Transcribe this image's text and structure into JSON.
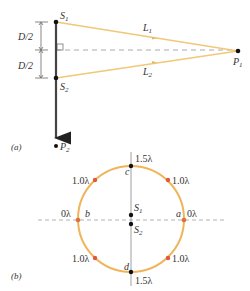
{
  "colors": {
    "ray": "#f0c878",
    "circle": "#f0b45a",
    "red_point": "#e0593a",
    "black": "#111111",
    "axis": "#999999",
    "dashed": "#aaaaaa"
  },
  "panel_a": {
    "label": "(a)",
    "sources": [
      {
        "name": "S",
        "sub": "1"
      },
      {
        "name": "S",
        "sub": "2"
      }
    ],
    "points": [
      {
        "name": "P",
        "sub": "1"
      },
      {
        "name": "P",
        "sub": "2"
      }
    ],
    "paths": [
      {
        "name": "L",
        "sub": "1"
      },
      {
        "name": "L",
        "sub": "2"
      }
    ],
    "dimension_upper": "D/2",
    "dimension_lower": "D/2"
  },
  "panel_b": {
    "label": "(b)",
    "sources": [
      {
        "name": "S",
        "sub": "1"
      },
      {
        "name": "S",
        "sub": "2"
      }
    ],
    "points": {
      "a": {
        "letter": "a",
        "value": "0λ"
      },
      "b": {
        "letter": "b",
        "value": "0λ"
      },
      "c": {
        "letter": "c",
        "value": "1.5λ"
      },
      "d": {
        "letter": "d",
        "value": "1.5λ"
      }
    },
    "red_points": [
      {
        "position": "upper-left",
        "value": "1.0λ"
      },
      {
        "position": "upper-right",
        "value": "1.0λ"
      },
      {
        "position": "lower-left",
        "value": "1.0λ"
      },
      {
        "position": "lower-right",
        "value": "1.0λ"
      }
    ]
  }
}
